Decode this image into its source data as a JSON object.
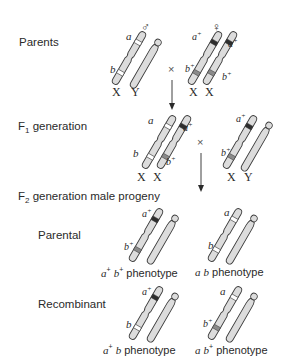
{
  "rows": {
    "parents": {
      "label": "Parents"
    },
    "f1": {
      "label_main": "F",
      "label_sub": "1",
      "label_rest": " generation"
    },
    "f2": {
      "label_main": "F",
      "label_sub": "2",
      "label_rest": " generation male progeny"
    },
    "parental": {
      "label": "Parental"
    },
    "recombinant": {
      "label": "Recombinant"
    }
  },
  "symbols": {
    "male": "♂",
    "female": "♀",
    "cross": "×"
  },
  "chromosome_labels": {
    "X": "X",
    "Y": "Y"
  },
  "alleles": {
    "a": "a",
    "b": "b",
    "a_plus": "a",
    "b_plus": "b",
    "plus": "+"
  },
  "phenotypes": {
    "parental_1": {
      "allele1": "a",
      "sup1": "+",
      "allele2": "b",
      "sup2": "+",
      "word": " phenotype"
    },
    "parental_2": {
      "allele1": "a",
      "sup1": "",
      "allele2": "b",
      "sup2": "",
      "word": " phenotype"
    },
    "recombinant_1": {
      "allele1": "a",
      "sup1": "+",
      "allele2": "b",
      "sup2": "",
      "word": " phenotype"
    },
    "recombinant_2": {
      "allele1": "a",
      "sup1": "",
      "allele2": "b",
      "sup2": "+",
      "word": " phenotype"
    }
  },
  "colors": {
    "chromosome_fill": "#dcdcdc",
    "chromosome_stroke": "#3a3a3a",
    "wild_band": "#2e2e2e",
    "mutant_band": "#ffffff",
    "b_plus_band": "#8a8a8a",
    "text": "#2a2a2a"
  }
}
